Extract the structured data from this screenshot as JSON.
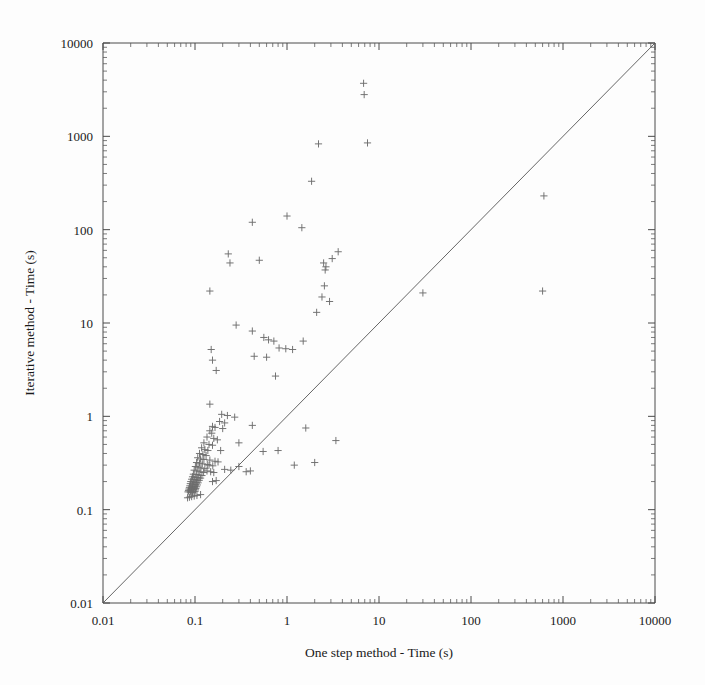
{
  "chart_data": {
    "type": "scatter",
    "title": "",
    "xlabel": "One step method - Time (s)",
    "ylabel": "Iterative method - Time (s)",
    "xscale": "log",
    "yscale": "log",
    "xlim": [
      0.01,
      10000
    ],
    "ylim": [
      0.01,
      10000
    ],
    "xticks": [
      0.01,
      0.1,
      1,
      10,
      100,
      1000,
      10000
    ],
    "xticklabels": [
      "0.01",
      "0.1",
      "1",
      "10",
      "100",
      "1000",
      "10000"
    ],
    "yticks": [
      0.01,
      0.1,
      1,
      10,
      100,
      1000,
      10000
    ],
    "yticklabels": [
      "0.01",
      "0.1",
      "1",
      "10",
      "100",
      "1000",
      "10000"
    ],
    "grid": false,
    "legend": null,
    "marker": "plus",
    "marker_color": "#6e6e6e",
    "reference_line": {
      "name": "identity-line",
      "description": "y = x diagonal",
      "from": [
        0.01,
        0.01
      ],
      "to": [
        10000,
        10000
      ],
      "color": "#555555"
    },
    "series": [
      {
        "name": "benchmark-instances",
        "points": [
          [
            6.8,
            3700
          ],
          [
            6.9,
            2800
          ],
          [
            2.2,
            830
          ],
          [
            7.5,
            850
          ],
          [
            1.85,
            330
          ],
          [
            1.0,
            140
          ],
          [
            1.45,
            105
          ],
          [
            0.42,
            120
          ],
          [
            620,
            230
          ],
          [
            0.23,
            55
          ],
          [
            0.24,
            44
          ],
          [
            2.5,
            44
          ],
          [
            2.65,
            40
          ],
          [
            2.6,
            37
          ],
          [
            3.6,
            58
          ],
          [
            3.1,
            49
          ],
          [
            0.5,
            47
          ],
          [
            2.55,
            25
          ],
          [
            2.4,
            19
          ],
          [
            2.9,
            17
          ],
          [
            30,
            21
          ],
          [
            600,
            22
          ],
          [
            0.145,
            22
          ],
          [
            2.1,
            13
          ],
          [
            0.28,
            9.5
          ],
          [
            0.42,
            8.2
          ],
          [
            0.56,
            7.0
          ],
          [
            0.63,
            6.6
          ],
          [
            0.72,
            6.4
          ],
          [
            1.5,
            6.4
          ],
          [
            0.82,
            5.4
          ],
          [
            0.97,
            5.3
          ],
          [
            1.15,
            5.2
          ],
          [
            0.15,
            5.2
          ],
          [
            0.155,
            4.0
          ],
          [
            0.44,
            4.4
          ],
          [
            0.6,
            4.3
          ],
          [
            0.17,
            3.1
          ],
          [
            0.75,
            2.7
          ],
          [
            0.145,
            1.35
          ],
          [
            0.195,
            1.05
          ],
          [
            0.225,
            1.02
          ],
          [
            0.27,
            0.98
          ],
          [
            0.185,
            0.88
          ],
          [
            0.21,
            0.85
          ],
          [
            0.155,
            0.78
          ],
          [
            0.165,
            0.76
          ],
          [
            0.2,
            0.74
          ],
          [
            0.42,
            0.8
          ],
          [
            0.145,
            0.7
          ],
          [
            0.152,
            0.66
          ],
          [
            0.135,
            0.6
          ],
          [
            0.16,
            0.58
          ],
          [
            0.175,
            0.56
          ],
          [
            0.125,
            0.52
          ],
          [
            0.142,
            0.5
          ],
          [
            0.155,
            0.49
          ],
          [
            0.3,
            0.52
          ],
          [
            1.6,
            0.75
          ],
          [
            3.4,
            0.55
          ],
          [
            0.118,
            0.46
          ],
          [
            0.128,
            0.44
          ],
          [
            0.138,
            0.43
          ],
          [
            0.19,
            0.43
          ],
          [
            0.112,
            0.4
          ],
          [
            0.122,
            0.39
          ],
          [
            0.132,
            0.38
          ],
          [
            0.107,
            0.36
          ],
          [
            0.115,
            0.35
          ],
          [
            0.125,
            0.345
          ],
          [
            0.145,
            0.34
          ],
          [
            0.104,
            0.32
          ],
          [
            0.112,
            0.315
          ],
          [
            0.12,
            0.31
          ],
          [
            0.136,
            0.305
          ],
          [
            0.101,
            0.29
          ],
          [
            0.108,
            0.285
          ],
          [
            0.116,
            0.28
          ],
          [
            0.128,
            0.275
          ],
          [
            0.098,
            0.265
          ],
          [
            0.105,
            0.26
          ],
          [
            0.113,
            0.255
          ],
          [
            0.124,
            0.25
          ],
          [
            0.096,
            0.24
          ],
          [
            0.103,
            0.238
          ],
          [
            0.11,
            0.235
          ],
          [
            0.119,
            0.232
          ],
          [
            0.094,
            0.225
          ],
          [
            0.1,
            0.222
          ],
          [
            0.107,
            0.22
          ],
          [
            0.115,
            0.218
          ],
          [
            0.092,
            0.212
          ],
          [
            0.098,
            0.21
          ],
          [
            0.104,
            0.208
          ],
          [
            0.111,
            0.206
          ],
          [
            0.09,
            0.2
          ],
          [
            0.096,
            0.198
          ],
          [
            0.102,
            0.196
          ],
          [
            0.108,
            0.194
          ],
          [
            0.089,
            0.19
          ],
          [
            0.094,
            0.188
          ],
          [
            0.1,
            0.186
          ],
          [
            0.106,
            0.184
          ],
          [
            0.088,
            0.18
          ],
          [
            0.093,
            0.178
          ],
          [
            0.098,
            0.177
          ],
          [
            0.104,
            0.176
          ],
          [
            0.087,
            0.172
          ],
          [
            0.092,
            0.171
          ],
          [
            0.097,
            0.17
          ],
          [
            0.102,
            0.169
          ],
          [
            0.086,
            0.166
          ],
          [
            0.091,
            0.165
          ],
          [
            0.096,
            0.164
          ],
          [
            0.101,
            0.163
          ],
          [
            0.085,
            0.16
          ],
          [
            0.09,
            0.159
          ],
          [
            0.095,
            0.158
          ],
          [
            0.1,
            0.157
          ],
          [
            0.084,
            0.155
          ],
          [
            0.089,
            0.154
          ],
          [
            0.094,
            0.153
          ],
          [
            0.135,
            0.26
          ],
          [
            0.148,
            0.255
          ],
          [
            0.16,
            0.25
          ],
          [
            0.142,
            0.3
          ],
          [
            0.156,
            0.295
          ],
          [
            0.165,
            0.33
          ],
          [
            0.178,
            0.325
          ],
          [
            0.21,
            0.27
          ],
          [
            0.245,
            0.265
          ],
          [
            0.3,
            0.29
          ],
          [
            0.36,
            0.255
          ],
          [
            0.4,
            0.26
          ],
          [
            0.155,
            0.2
          ],
          [
            0.17,
            0.205
          ],
          [
            0.55,
            0.42
          ],
          [
            0.8,
            0.43
          ],
          [
            1.2,
            0.3
          ],
          [
            2.0,
            0.32
          ],
          [
            0.115,
            0.145
          ],
          [
            0.105,
            0.142
          ],
          [
            0.098,
            0.14
          ],
          [
            0.092,
            0.138
          ],
          [
            0.087,
            0.136
          ],
          [
            0.083,
            0.134
          ]
        ]
      }
    ]
  },
  "axes": {
    "x_title": "One step method - Time (s)",
    "y_title": "Iterative method - Time (s)"
  }
}
